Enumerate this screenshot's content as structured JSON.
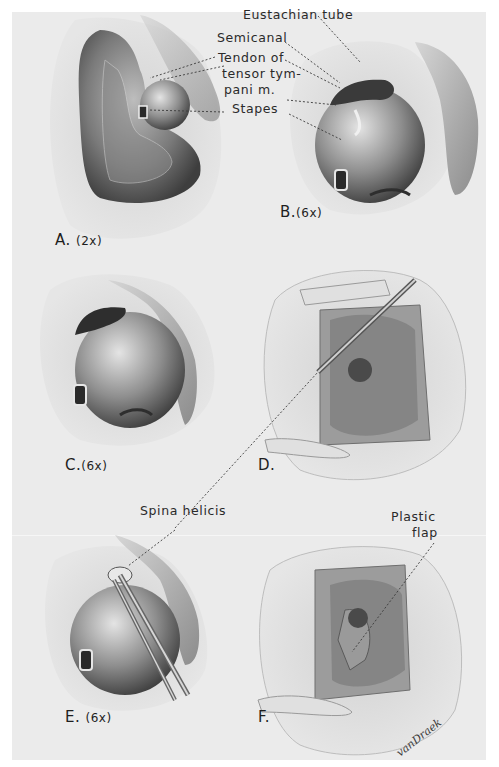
{
  "figure": {
    "panels": [
      {
        "id": "A",
        "letter": "A.",
        "magnification": "(2x)"
      },
      {
        "id": "B",
        "letter": "B.",
        "magnification": "(6x)"
      },
      {
        "id": "C",
        "letter": "C.",
        "magnification": "(6x)"
      },
      {
        "id": "D",
        "letter": "D.",
        "magnification": ""
      },
      {
        "id": "E",
        "letter": "E.",
        "magnification": "(6x)"
      },
      {
        "id": "F",
        "letter": "F.",
        "magnification": ""
      }
    ],
    "annotations": {
      "eustachian_tube": "Eustachian tube",
      "semicanal": "Semicanal",
      "tendon_line1": "Tendon of",
      "tendon_line2": "tensor tym-",
      "tendon_line3": "pani m.",
      "stapes": "Stapes",
      "spina_helicis": "Spina helicis",
      "plastic_flap_line1": "Plastic",
      "plastic_flap_line2": "flap"
    },
    "signature": "vanDraek"
  },
  "colors": {
    "background": "#ffffff",
    "panel": "#ebebeb",
    "ink": "#2a2a2a",
    "tissue_dark": "#6b6b6b",
    "tissue_mid": "#9a9a9a",
    "tissue_light": "#d4d4d4"
  }
}
